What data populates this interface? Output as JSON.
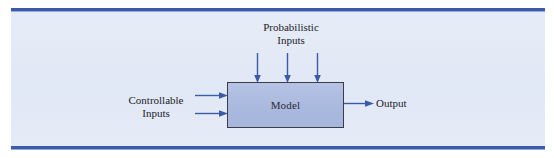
{
  "figure": {
    "background_color": "#e4eaf6",
    "rule_color": "#3b5ba8",
    "arrow_color": "#3b5ba8",
    "box_fill_color": "#aebce0",
    "box_border_color": "#3c3c44",
    "text_color": "#22222a"
  },
  "nodes": {
    "model": {
      "label": "Model"
    }
  },
  "labels": {
    "probabilistic_inputs": {
      "line1": "Probabilistic",
      "line2": "Inputs"
    },
    "controllable_inputs": {
      "line1": "Controllable",
      "line2": "Inputs"
    },
    "output": {
      "text": "Output"
    }
  },
  "arrows": {
    "probabilistic": [
      {
        "name": "probabilistic-arrow-1",
        "direction": "down"
      },
      {
        "name": "probabilistic-arrow-2",
        "direction": "down"
      },
      {
        "name": "probabilistic-arrow-3",
        "direction": "down"
      }
    ],
    "controllable": [
      {
        "name": "controllable-arrow-1",
        "direction": "right"
      },
      {
        "name": "controllable-arrow-2",
        "direction": "right"
      }
    ],
    "output": [
      {
        "name": "output-arrow",
        "direction": "right"
      }
    ]
  }
}
